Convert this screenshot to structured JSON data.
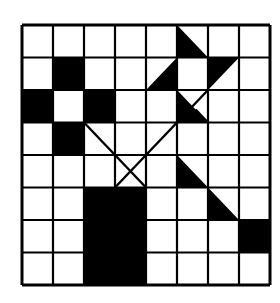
{
  "figure": {
    "title": "",
    "grid": {
      "rows": 8,
      "cols": 8,
      "left": 22,
      "top": 25,
      "right": 270,
      "bottom": 285
    },
    "colors": {
      "ink": "#000000",
      "paper": "#ffffff"
    },
    "filled_cells": [
      [
        1,
        1
      ],
      [
        2,
        0
      ],
      [
        2,
        2
      ],
      [
        3,
        1
      ],
      [
        5,
        2
      ],
      [
        5,
        3
      ],
      [
        6,
        2
      ],
      [
        6,
        3
      ],
      [
        7,
        2
      ],
      [
        7,
        3
      ],
      [
        6,
        7
      ]
    ],
    "triangles": [
      {
        "name": "pinwheel-top",
        "pts": [
          [
            0,
            5
          ],
          [
            1,
            5
          ],
          [
            1,
            6
          ]
        ]
      },
      {
        "name": "pinwheel-left",
        "pts": [
          [
            2,
            4
          ],
          [
            1,
            5
          ],
          [
            2,
            5
          ]
        ]
      },
      {
        "name": "pinwheel-right",
        "pts": [
          [
            1,
            6
          ],
          [
            1,
            7
          ],
          [
            2,
            6
          ]
        ]
      },
      {
        "name": "pinwheel-bottom",
        "pts": [
          [
            2,
            5
          ],
          [
            3,
            5
          ],
          [
            3,
            6
          ]
        ]
      },
      {
        "name": "diag-tri-1",
        "pts": [
          [
            4,
            5
          ],
          [
            5,
            5
          ],
          [
            5,
            6
          ]
        ]
      },
      {
        "name": "diag-tri-2",
        "pts": [
          [
            5,
            6
          ],
          [
            6,
            6
          ],
          [
            6,
            7
          ]
        ]
      }
    ],
    "lines": [
      {
        "name": "x-line-1",
        "from": [
          3,
          2
        ],
        "to": [
          5,
          4
        ]
      },
      {
        "name": "x-line-2",
        "from": [
          2,
          6
        ],
        "to": [
          5,
          3
        ]
      },
      {
        "name": "x-line-3",
        "from": [
          3,
          6
        ],
        "to": [
          2.6,
          5.6
        ]
      }
    ]
  }
}
